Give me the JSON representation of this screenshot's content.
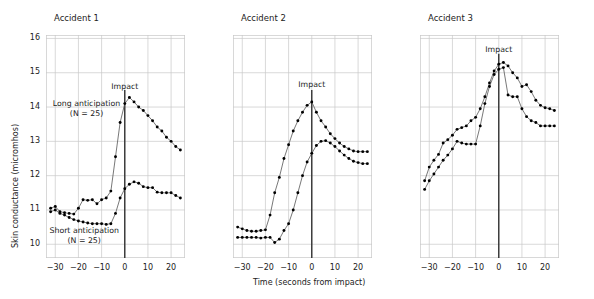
{
  "figure": {
    "xlabel": "Time (seconds from impact)",
    "ylabel": "Skin conductance (micromhos)",
    "impact_label": "Impact",
    "series_labels": {
      "long": "Long anticipation",
      "long_n": "(N = 25)",
      "short": "Short anticipation",
      "short_n": "(N = 25)"
    },
    "colors": {
      "grid": "#c8c8c8",
      "marker": "#000000",
      "line": "#555555",
      "impact_rule": "#333333",
      "text": "#222222"
    }
  },
  "chart_data": [
    {
      "type": "line",
      "title": "Accident 1",
      "xlabel": "Time (seconds from impact)",
      "ylabel": "Skin conductance (micromhos)",
      "xlim": [
        -34,
        26
      ],
      "ylim": [
        9.6,
        16.1
      ],
      "xticks": [
        -30,
        -20,
        -10,
        0,
        10,
        20
      ],
      "yticks": [
        10,
        11,
        12,
        13,
        14,
        15,
        16
      ],
      "grid": true,
      "legend": "inline-annotations",
      "annotations": [
        {
          "text": "Impact",
          "x": 0,
          "y": 14.55
        },
        {
          "text": "Long anticipation",
          "x": -16.5,
          "y": 14.05
        },
        {
          "text": "(N = 25)",
          "x": -16.5,
          "y": 13.78
        },
        {
          "text": "Short anticipation",
          "x": -17.5,
          "y": 10.35
        },
        {
          "text": "(N = 25)",
          "x": -17.5,
          "y": 10.08
        }
      ],
      "impact_line_x": 0,
      "series": [
        {
          "name": "Long anticipation (N = 25)",
          "x": [
            -32,
            -30,
            -28,
            -26,
            -24,
            -22,
            -20,
            -18,
            -16,
            -14,
            -12,
            -10,
            -8,
            -6,
            -4,
            -2,
            0,
            2,
            4,
            6,
            8,
            10,
            12,
            14,
            16,
            18,
            20,
            22,
            24
          ],
          "values": [
            11.05,
            11.1,
            10.95,
            10.92,
            10.9,
            10.88,
            11.05,
            11.3,
            11.28,
            11.3,
            11.18,
            11.3,
            11.35,
            11.55,
            12.55,
            13.55,
            14.1,
            14.28,
            14.15,
            14.0,
            13.9,
            13.75,
            13.6,
            13.42,
            13.3,
            13.12,
            13.0,
            12.85,
            12.75
          ]
        },
        {
          "name": "Short anticipation (N = 25)",
          "x": [
            -32,
            -30,
            -28,
            -26,
            -24,
            -22,
            -20,
            -18,
            -16,
            -14,
            -12,
            -10,
            -8,
            -6,
            -4,
            -2,
            0,
            2,
            4,
            6,
            8,
            10,
            12,
            14,
            16,
            18,
            20,
            22,
            24
          ],
          "values": [
            10.95,
            11.0,
            10.9,
            10.85,
            10.78,
            10.72,
            10.68,
            10.65,
            10.62,
            10.6,
            10.6,
            10.6,
            10.58,
            10.6,
            10.9,
            11.35,
            11.62,
            11.75,
            11.82,
            11.78,
            11.68,
            11.65,
            11.65,
            11.52,
            11.5,
            11.5,
            11.5,
            11.42,
            11.35
          ]
        }
      ]
    },
    {
      "type": "line",
      "title": "Accident 2",
      "xlabel": "Time (seconds from impact)",
      "ylabel": "Skin conductance (micromhos)",
      "xlim": [
        -34,
        26
      ],
      "ylim": [
        9.6,
        16.1
      ],
      "xticks": [
        -30,
        -20,
        -10,
        0,
        10,
        20
      ],
      "yticks": [
        10,
        11,
        12,
        13,
        14,
        15,
        16
      ],
      "grid": true,
      "annotations": [
        {
          "text": "Impact",
          "x": 0,
          "y": 14.6
        }
      ],
      "impact_line_x": 0,
      "series": [
        {
          "name": "Long anticipation (N = 25)",
          "x": [
            -32,
            -30,
            -28,
            -26,
            -24,
            -22,
            -20,
            -18,
            -16,
            -14,
            -12,
            -10,
            -8,
            -6,
            -4,
            -2,
            0,
            2,
            4,
            6,
            8,
            10,
            12,
            14,
            16,
            18,
            20,
            22,
            24
          ],
          "values": [
            10.5,
            10.45,
            10.4,
            10.38,
            10.38,
            10.4,
            10.42,
            10.85,
            11.5,
            11.95,
            12.5,
            12.9,
            13.3,
            13.6,
            13.85,
            14.05,
            14.15,
            13.85,
            13.6,
            13.42,
            13.22,
            13.08,
            12.95,
            12.85,
            12.78,
            12.72,
            12.7,
            12.7,
            12.7
          ]
        },
        {
          "name": "Short anticipation (N = 25)",
          "x": [
            -32,
            -30,
            -28,
            -26,
            -24,
            -22,
            -20,
            -18,
            -16,
            -14,
            -12,
            -10,
            -8,
            -6,
            -4,
            -2,
            0,
            2,
            4,
            6,
            8,
            10,
            12,
            14,
            16,
            18,
            20,
            22,
            24
          ],
          "values": [
            10.2,
            10.2,
            10.2,
            10.2,
            10.2,
            10.18,
            10.2,
            10.2,
            10.05,
            10.15,
            10.4,
            10.6,
            11.0,
            11.5,
            12.0,
            12.4,
            12.65,
            12.88,
            13.0,
            13.02,
            12.95,
            12.85,
            12.72,
            12.6,
            12.5,
            12.42,
            12.38,
            12.35,
            12.35
          ]
        }
      ]
    },
    {
      "type": "line",
      "title": "Accident 3",
      "xlabel": "Time (seconds from impact)",
      "ylabel": "Skin conductance (micromhos)",
      "xlim": [
        -34,
        26
      ],
      "ylim": [
        9.6,
        16.1
      ],
      "xticks": [
        -30,
        -20,
        -10,
        0,
        10,
        20
      ],
      "yticks": [
        10,
        11,
        12,
        13,
        14,
        15,
        16
      ],
      "grid": true,
      "annotations": [
        {
          "text": "Impact",
          "x": 0,
          "y": 15.62
        }
      ],
      "impact_line_x": 0,
      "series": [
        {
          "name": "Long anticipation (N = 25)",
          "x": [
            -32,
            -30,
            -28,
            -26,
            -24,
            -22,
            -20,
            -18,
            -16,
            -14,
            -12,
            -10,
            -8,
            -6,
            -4,
            -2,
            0,
            2,
            4,
            6,
            8,
            10,
            12,
            14,
            16,
            18,
            20,
            22,
            24
          ],
          "values": [
            11.85,
            12.25,
            12.45,
            12.62,
            12.95,
            13.05,
            13.18,
            13.35,
            13.4,
            13.45,
            13.6,
            13.7,
            13.95,
            14.3,
            14.7,
            15.05,
            15.25,
            15.3,
            15.2,
            15.0,
            14.85,
            14.6,
            14.65,
            14.45,
            14.2,
            14.05,
            13.98,
            13.95,
            13.9
          ]
        },
        {
          "name": "Short anticipation (N = 25)",
          "x": [
            -32,
            -30,
            -28,
            -26,
            -24,
            -22,
            -20,
            -18,
            -16,
            -14,
            -12,
            -10,
            -8,
            -6,
            -4,
            -2,
            0,
            2,
            4,
            6,
            8,
            10,
            12,
            14,
            16,
            18,
            20,
            22,
            24
          ],
          "values": [
            11.6,
            11.85,
            12.05,
            12.25,
            12.45,
            12.6,
            12.78,
            13.0,
            12.95,
            12.92,
            12.92,
            12.92,
            13.45,
            14.1,
            14.6,
            14.95,
            15.1,
            15.15,
            14.35,
            14.3,
            14.3,
            13.95,
            13.72,
            13.6,
            13.55,
            13.45,
            13.45,
            13.45,
            13.45
          ]
        }
      ]
    }
  ]
}
